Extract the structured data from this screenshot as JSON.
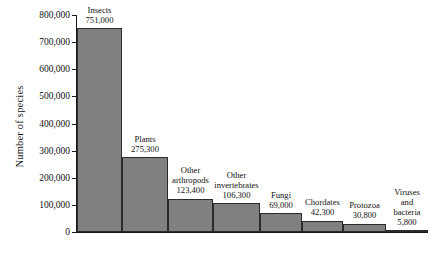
{
  "chart_data": {
    "type": "bar",
    "title": "",
    "xlabel": "",
    "ylabel": "Number of species",
    "ylim": [
      0,
      800000
    ],
    "grid": false,
    "legend": "none",
    "bar_color": "#808080",
    "bar_edge_color": "#2b2b2b",
    "background": "#ffffff",
    "axis_color": "#1a1a1a",
    "ytick_labels": [
      "800,000",
      "700,000",
      "600,000",
      "500,000",
      "400,000",
      "300,000",
      "200,000",
      "100,000",
      "0"
    ],
    "ytick_values": [
      800000,
      700000,
      600000,
      500000,
      400000,
      300000,
      200000,
      100000,
      0
    ],
    "categories": [
      "Insects",
      "Plants",
      "Other arthropods",
      "Other invertebrates",
      "Fungi",
      "Chordates",
      "Protozoa",
      "Viruses and bacteria"
    ],
    "values": [
      751000,
      275300,
      123400,
      106300,
      69000,
      42300,
      30800,
      5800
    ],
    "value_labels": [
      "751,000",
      "275,300",
      "123,400",
      "106,300",
      "69,000",
      "42,300",
      "30,800",
      "5,800"
    ],
    "bars": [
      {
        "name": "Insects",
        "name_lines": [
          "Insects"
        ],
        "value": 751000,
        "value_label": "751,000"
      },
      {
        "name": "Plants",
        "name_lines": [
          "Plants"
        ],
        "value": 275300,
        "value_label": "275,300"
      },
      {
        "name": "Other arthropods",
        "name_lines": [
          "Other",
          "arthropods"
        ],
        "value": 123400,
        "value_label": "123,400"
      },
      {
        "name": "Other invertebrates",
        "name_lines": [
          "Other",
          "invertebrates"
        ],
        "value": 106300,
        "value_label": "106,300"
      },
      {
        "name": "Fungi",
        "name_lines": [
          "Fungi"
        ],
        "value": 69000,
        "value_label": "69,000"
      },
      {
        "name": "Chordates",
        "name_lines": [
          "Chordates"
        ],
        "value": 42300,
        "value_label": "42,300"
      },
      {
        "name": "Protozoa",
        "name_lines": [
          "Protozoa"
        ],
        "value": 30800,
        "value_label": "30,800"
      },
      {
        "name": "Viruses and bacteria",
        "name_lines": [
          "Viruses",
          "and",
          "bacteria"
        ],
        "value": 5800,
        "value_label": "5,800"
      }
    ]
  }
}
